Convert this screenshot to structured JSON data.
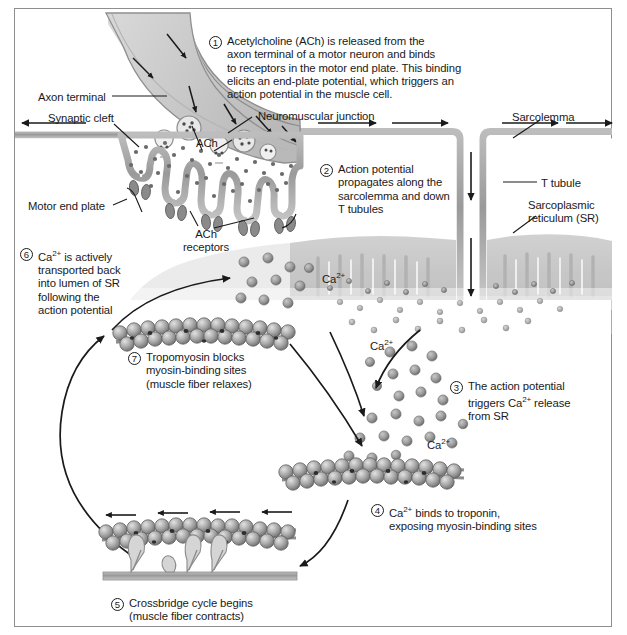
{
  "figure": {
    "background_color": "#ffffff",
    "border_color": "#8e8e8e",
    "ink_color": "#1a1a1a",
    "tissue_fill": "#c9c9c9",
    "membrane_color": "#9a9a9a",
    "ion_color": "#8f8f8f"
  },
  "steps": [
    {
      "number": "1",
      "text": "Acetylcholine (ACh) is released from the\naxon terminal of a motor neuron and binds\nto receptors in the motor end plate. This binding\nelicits an end-plate potential, which triggers an\naction potential in the muscle cell."
    },
    {
      "number": "2",
      "text": "Action potential\npropagates along the\nsarcolemma and down\nT tubules"
    },
    {
      "number": "3",
      "text": "The action potential\ntriggers Ca2+ release\nfrom SR",
      "text_pre": "The action potential\ntriggers Ca",
      "text_sup": "2+",
      "text_post": " release\nfrom SR"
    },
    {
      "number": "4",
      "text": "Ca2+ binds to troponin,\nexposing myosin-binding sites",
      "text_pre": "Ca",
      "text_sup": "2+",
      "text_post": " binds to troponin,\nexposing myosin-binding sites"
    },
    {
      "number": "5",
      "text": "Crossbridge cycle begins\n(muscle fiber contracts)"
    },
    {
      "number": "6",
      "text": "Ca2+ is actively\ntransported back\ninto lumen of SR\nfollowing the\naction potential",
      "text_pre": "Ca",
      "text_sup": "2+",
      "text_post": " is actively\ntransported back\ninto lumen of SR\nfollowing the\naction potential"
    },
    {
      "number": "7",
      "text": "Tropomyosin blocks\nmyosin-binding sites\n(muscle fiber relaxes)"
    }
  ],
  "labels": {
    "axon_terminal": "Axon terminal",
    "synaptic_cleft": "Synaptic cleft",
    "motor_end_plate": "Motor end plate",
    "ach": "ACh",
    "ach_receptors": "ACh\nreceptors",
    "neuromuscular_junction": "Neuromuscular junction",
    "sarcolemma": "Sarcolemma",
    "t_tubule": "T tubule",
    "sarcoplasmic_reticulum": "Sarcoplasmic\nreticulum (SR)",
    "calcium_ion": "Ca",
    "calcium_charge": "2+"
  },
  "calcium_labels": [
    {
      "id": "ca-upper-left",
      "base": "Ca",
      "sup": "2+"
    },
    {
      "id": "ca-mid-left",
      "base": "Ca",
      "sup": "2+"
    },
    {
      "id": "ca-mid-right",
      "base": "Ca",
      "sup": "2+"
    }
  ]
}
